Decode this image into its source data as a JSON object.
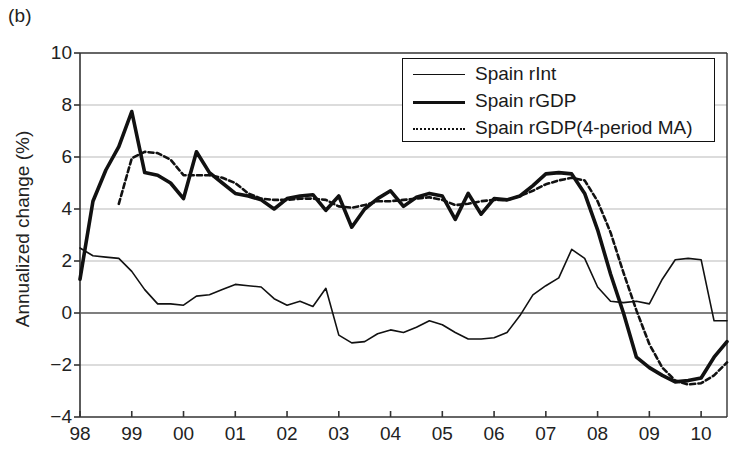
{
  "panel_label": "(b)",
  "axes": {
    "ylabel": "Annualized change (%)",
    "xlabel": "",
    "yticks": [
      10,
      8,
      6,
      4,
      2,
      0,
      -2,
      -4
    ],
    "ytick_labels": [
      "10",
      "8",
      "6",
      "4",
      "2",
      "0",
      "−2",
      "−4"
    ],
    "xtick_labels": [
      "98",
      "99",
      "00",
      "01",
      "02",
      "03",
      "04",
      "05",
      "06",
      "07",
      "08",
      "09",
      "10"
    ],
    "ylim": [
      -4,
      10
    ],
    "xlim": [
      1998,
      2010.5
    ],
    "grid": "horizontal",
    "zero_line": true
  },
  "legend": {
    "position": "top-right",
    "entries": [
      {
        "label": "Spain rInt",
        "style": "thin-solid",
        "swatch": "thin"
      },
      {
        "label": "Spain rGDP",
        "style": "thick-solid",
        "swatch": "thick"
      },
      {
        "label": "Spain rGDP(4-period MA)",
        "style": "dotted",
        "swatch": "dash"
      }
    ]
  },
  "colors": {
    "line": "#111111",
    "grid": "#b9b9b9",
    "axis": "#333333",
    "background": "#ffffff"
  },
  "chart_data": {
    "type": "line",
    "title": "",
    "subtitle": "",
    "xlabel": "",
    "ylabel": "Annualized change (%)",
    "xlim": [
      1998,
      2010.5
    ],
    "ylim": [
      -4,
      10
    ],
    "xticks": [
      1998,
      1999,
      2000,
      2001,
      2002,
      2003,
      2004,
      2005,
      2006,
      2007,
      2008,
      2009,
      2010
    ],
    "xtick_labels": [
      "98",
      "99",
      "00",
      "01",
      "02",
      "03",
      "04",
      "05",
      "06",
      "07",
      "08",
      "09",
      "10"
    ],
    "yticks": [
      -4,
      -2,
      0,
      2,
      4,
      6,
      8,
      10
    ],
    "grid": true,
    "legend_position": "top-right",
    "series": [
      {
        "name": "Spain rInt",
        "style": "thin-solid",
        "x": [
          1998.0,
          1998.25,
          1998.5,
          1998.75,
          1999.0,
          1999.25,
          1999.5,
          1999.75,
          2000.0,
          2000.25,
          2000.5,
          2000.75,
          2001.0,
          2001.25,
          2001.5,
          2001.75,
          2002.0,
          2002.25,
          2002.5,
          2002.75,
          2003.0,
          2003.25,
          2003.5,
          2003.75,
          2004.0,
          2004.25,
          2004.5,
          2004.75,
          2005.0,
          2005.25,
          2005.5,
          2005.75,
          2006.0,
          2006.25,
          2006.5,
          2006.75,
          2007.0,
          2007.25,
          2007.5,
          2007.75,
          2008.0,
          2008.25,
          2008.5,
          2008.75,
          2009.0,
          2009.25,
          2009.5,
          2009.75,
          2010.0,
          2010.25,
          2010.5
        ],
        "y": [
          2.5,
          2.2,
          2.15,
          2.1,
          1.6,
          0.9,
          0.35,
          0.35,
          0.3,
          0.65,
          0.7,
          0.9,
          1.1,
          1.05,
          1.0,
          0.55,
          0.3,
          0.45,
          0.25,
          0.95,
          -0.85,
          -1.15,
          -1.1,
          -0.8,
          -0.65,
          -0.75,
          -0.55,
          -0.3,
          -0.45,
          -0.75,
          -1.0,
          -1.0,
          -0.95,
          -0.75,
          -0.1,
          0.7,
          1.05,
          1.35,
          2.45,
          2.1,
          1.0,
          0.45,
          0.4,
          0.45,
          0.35,
          1.3,
          2.05,
          2.1,
          2.05,
          -0.3,
          -0.3
        ]
      },
      {
        "name": "Spain rGDP",
        "style": "thick-solid",
        "x": [
          1998.0,
          1998.25,
          1998.5,
          1998.75,
          1999.0,
          1999.25,
          1999.5,
          1999.75,
          2000.0,
          2000.25,
          2000.5,
          2000.75,
          2001.0,
          2001.25,
          2001.5,
          2001.75,
          2002.0,
          2002.25,
          2002.5,
          2002.75,
          2003.0,
          2003.25,
          2003.5,
          2003.75,
          2004.0,
          2004.25,
          2004.5,
          2004.75,
          2005.0,
          2005.25,
          2005.5,
          2005.75,
          2006.0,
          2006.25,
          2006.5,
          2006.75,
          2007.0,
          2007.25,
          2007.5,
          2007.75,
          2008.0,
          2008.25,
          2008.5,
          2008.75,
          2009.0,
          2009.25,
          2009.5,
          2009.75,
          2010.0,
          2010.25,
          2010.5
        ],
        "y": [
          1.3,
          4.3,
          5.5,
          6.4,
          7.75,
          5.4,
          5.3,
          5.0,
          4.4,
          6.2,
          5.4,
          5.0,
          4.6,
          4.5,
          4.35,
          4.0,
          4.4,
          4.5,
          4.55,
          3.95,
          4.5,
          3.3,
          4.0,
          4.4,
          4.7,
          4.1,
          4.45,
          4.6,
          4.5,
          3.6,
          4.6,
          3.8,
          4.4,
          4.35,
          4.5,
          4.9,
          5.35,
          5.4,
          5.35,
          4.6,
          3.2,
          1.5,
          0.0,
          -1.7,
          -2.1,
          -2.4,
          -2.65,
          -2.6,
          -2.5,
          -1.7,
          -1.1
        ]
      },
      {
        "name": "Spain rGDP(4-period MA)",
        "style": "dotted",
        "x": [
          1998.75,
          1999.0,
          1999.25,
          1999.5,
          1999.75,
          2000.0,
          2000.25,
          2000.5,
          2000.75,
          2001.0,
          2001.25,
          2001.5,
          2001.75,
          2002.0,
          2002.25,
          2002.5,
          2002.75,
          2003.0,
          2003.25,
          2003.5,
          2003.75,
          2004.0,
          2004.25,
          2004.5,
          2004.75,
          2005.0,
          2005.25,
          2005.5,
          2005.75,
          2006.0,
          2006.25,
          2006.5,
          2006.75,
          2007.0,
          2007.25,
          2007.5,
          2007.75,
          2008.0,
          2008.25,
          2008.5,
          2008.75,
          2009.0,
          2009.25,
          2009.5,
          2009.75,
          2010.0,
          2010.25,
          2010.5
        ],
        "y": [
          4.2,
          5.95,
          6.2,
          6.15,
          5.9,
          5.3,
          5.3,
          5.3,
          5.2,
          5.0,
          4.6,
          4.4,
          4.35,
          4.35,
          4.4,
          4.4,
          4.35,
          4.1,
          4.05,
          4.15,
          4.3,
          4.3,
          4.35,
          4.4,
          4.45,
          4.35,
          4.15,
          4.2,
          4.3,
          4.35,
          4.35,
          4.5,
          4.7,
          4.95,
          5.1,
          5.2,
          5.1,
          4.3,
          3.1,
          1.55,
          0.1,
          -1.2,
          -2.1,
          -2.6,
          -2.75,
          -2.7,
          -2.4,
          -1.9
        ]
      }
    ]
  }
}
